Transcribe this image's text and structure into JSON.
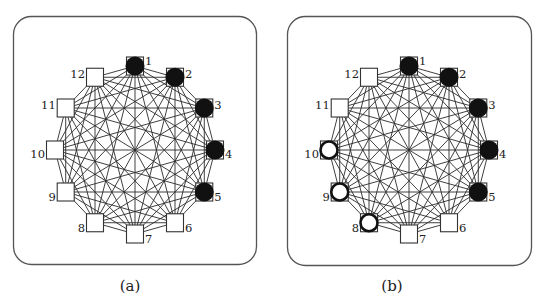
{
  "figure": {
    "node_count": 12,
    "edges": "complete",
    "colors": {
      "black_node": "#111111",
      "white_node_fill": "#ffffff",
      "outline": "#222222",
      "edge": "#2a2a2a"
    },
    "panels": [
      {
        "id": "a",
        "caption": "(a)",
        "nodes": [
          {
            "label": "1",
            "state": "black"
          },
          {
            "label": "2",
            "state": "black"
          },
          {
            "label": "3",
            "state": "black"
          },
          {
            "label": "4",
            "state": "black"
          },
          {
            "label": "5",
            "state": "black"
          },
          {
            "label": "6",
            "state": "empty"
          },
          {
            "label": "7",
            "state": "empty"
          },
          {
            "label": "8",
            "state": "empty"
          },
          {
            "label": "9",
            "state": "empty"
          },
          {
            "label": "10",
            "state": "empty"
          },
          {
            "label": "11",
            "state": "empty"
          },
          {
            "label": "12",
            "state": "empty"
          }
        ]
      },
      {
        "id": "b",
        "caption": "(b)",
        "nodes": [
          {
            "label": "1",
            "state": "black"
          },
          {
            "label": "2",
            "state": "black"
          },
          {
            "label": "3",
            "state": "black"
          },
          {
            "label": "4",
            "state": "black"
          },
          {
            "label": "5",
            "state": "black"
          },
          {
            "label": "6",
            "state": "empty"
          },
          {
            "label": "7",
            "state": "empty"
          },
          {
            "label": "8",
            "state": "white"
          },
          {
            "label": "9",
            "state": "white"
          },
          {
            "label": "10",
            "state": "white"
          },
          {
            "label": "11",
            "state": "empty"
          },
          {
            "label": "12",
            "state": "empty"
          }
        ]
      }
    ]
  }
}
